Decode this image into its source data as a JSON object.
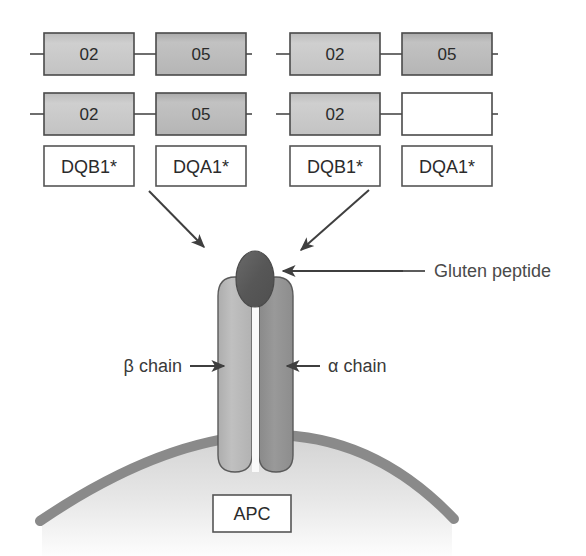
{
  "figure": {
    "background_color": "#ffffff"
  },
  "colors": {
    "gene_box_fill": "#c7c7c7",
    "gene_box_fill_dark": "#b9b9b9",
    "gene_box_stroke": "#4a4a4a",
    "empty_box_fill": "#ffffff",
    "label_box_fill": "#ffffff",
    "label_box_stroke": "#555555",
    "beta_chain_fill": "#b8b8b8",
    "alpha_chain_fill": "#8f8f8f",
    "chain_stroke": "#5a5a5a",
    "peptide_fill": "#5e5e5e",
    "membrane_stroke": "#8a8a8a",
    "cytoplasm_fill": "#e3e3e3",
    "arrow_color": "#3f3f3f",
    "callout_color": "#4a4a4a",
    "text_color": "#2b2b2b"
  },
  "haplotypes": [
    {
      "name": "haplotype-cis",
      "chromosomes": [
        {
          "name": "chromosome-1",
          "alleles": [
            {
              "value": "02",
              "filled": true
            },
            {
              "value": "05",
              "filled": true
            }
          ]
        },
        {
          "name": "chromosome-2",
          "alleles": [
            {
              "value": "02",
              "filled": true
            },
            {
              "value": "05",
              "filled": true
            }
          ]
        }
      ],
      "gene_labels": [
        "DQB1*",
        "DQA1*"
      ]
    },
    {
      "name": "haplotype-trans",
      "chromosomes": [
        {
          "name": "chromosome-1",
          "alleles": [
            {
              "value": "02",
              "filled": true
            },
            {
              "value": "05",
              "filled": true
            }
          ]
        },
        {
          "name": "chromosome-2",
          "alleles": [
            {
              "value": "02",
              "filled": true
            },
            {
              "value": "",
              "filled": false
            }
          ]
        }
      ],
      "gene_labels": [
        "DQB1*",
        "DQA1*"
      ]
    }
  ],
  "labels": {
    "gluten_peptide": "Gluten peptide",
    "beta_chain": "β chain",
    "alpha_chain": "α chain",
    "apc": "APC"
  },
  "arrows": [
    {
      "name": "arrow-left-haplotype-to-mhc",
      "direction": "down-right"
    },
    {
      "name": "arrow-right-haplotype-to-mhc",
      "direction": "down-left"
    },
    {
      "name": "arrow-gluten-peptide-callout",
      "direction": "left"
    },
    {
      "name": "arrow-beta-chain-callout",
      "direction": "right"
    },
    {
      "name": "arrow-alpha-chain-callout",
      "direction": "left"
    }
  ]
}
